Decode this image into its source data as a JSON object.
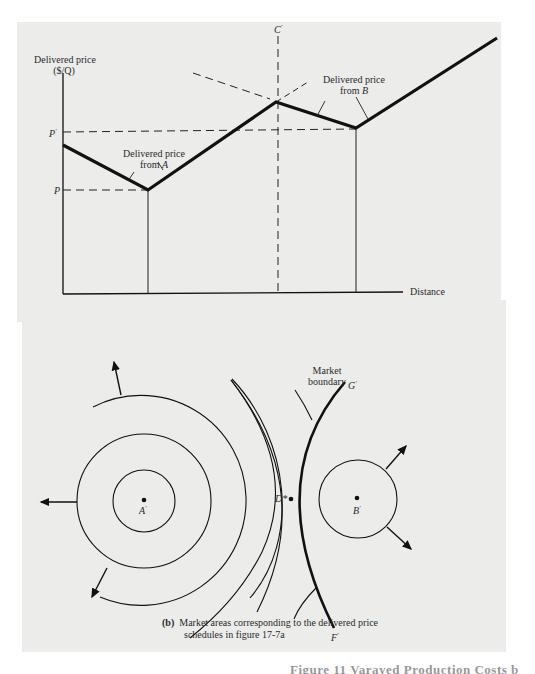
{
  "figure": {
    "panel_a": {
      "y_axis_label_line1": "Delivered price",
      "y_axis_label_line2": "($/Q)",
      "x_axis_label": "Distance",
      "y_ticks": {
        "p_prime": "P",
        "p": "P"
      },
      "x_ticks": {
        "a": "A",
        "d": "D",
        "b": "B"
      },
      "c_label": "C",
      "annotation_a_line1": "Delivered price",
      "annotation_a_line2_prefix": "from ",
      "annotation_a_line2_var": "A",
      "annotation_b_line1": "Delivered price",
      "annotation_b_line2_prefix": "from ",
      "annotation_b_line2_var": "B",
      "caption_tag": "(a)",
      "caption_text": "Delivered price schedules",
      "prime": "'"
    },
    "panel_b": {
      "market_boundary_line1": "Market",
      "market_boundary_line2": "boundary",
      "g_label": "G",
      "f_label": "F",
      "d_star_label": "D*",
      "a_label": "A",
      "b_label": "B",
      "caption_tag": "(b)",
      "caption_line1": "Market areas corresponding to the delivered price",
      "caption_line2": "schedules in figure 17-7a"
    },
    "footer_text": "Figure 11 Varayed Production Costs b"
  },
  "colors": {
    "panel_bg": "#ececea",
    "ink": "#111111",
    "page_bg": "#ffffff"
  }
}
